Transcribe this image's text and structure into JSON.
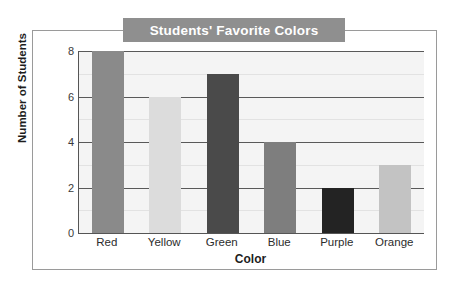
{
  "chart_data": {
    "type": "bar",
    "title": "Students' Favorite Colors",
    "xlabel": "Color",
    "ylabel": "Number of Students",
    "categories": [
      "Red",
      "Yellow",
      "Green",
      "Blue",
      "Purple",
      "Orange"
    ],
    "values": [
      8,
      6,
      7,
      4,
      2,
      3
    ],
    "bar_colors": [
      "#8a8a8a",
      "#dcdcdc",
      "#4a4a4a",
      "#7e7e7e",
      "#232323",
      "#c3c3c3"
    ],
    "ylim": [
      0,
      8
    ],
    "yticks": [
      0,
      2,
      4,
      6,
      8
    ],
    "ytick_labels": [
      "0",
      "2",
      "4",
      "6",
      "8"
    ],
    "minor_gridlines": [
      1,
      3,
      5,
      7
    ],
    "grid": true,
    "legend": "none",
    "plot_background": "#f4f4f4",
    "title_banner_color": "#8f8f8f",
    "title_text_color": "#ffffff",
    "frame_color": "#9a9a9a",
    "axis_color": "#555555"
  }
}
